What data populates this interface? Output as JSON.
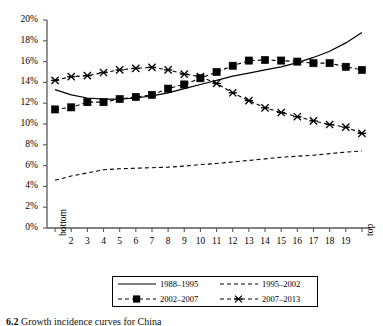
{
  "figure": {
    "caption_number": "6.2",
    "caption_text": "Growth incidence curves for China"
  },
  "axes": {
    "y_ticks": [
      "0%",
      "2%",
      "4%",
      "6%",
      "8%",
      "10%",
      "12%",
      "14%",
      "16%",
      "18%",
      "20%"
    ],
    "y_label": "",
    "x_label": "",
    "x_ticks": [
      "bottom",
      "2",
      "3",
      "4",
      "5",
      "6",
      "7",
      "8",
      "9",
      "10",
      "11",
      "12",
      "13",
      "14",
      "15",
      "16",
      "17",
      "18",
      "19",
      "top"
    ]
  },
  "legend": {
    "entries": [
      {
        "label": "1988–1995",
        "style": "solid",
        "marker": "none"
      },
      {
        "label": "1995–2002",
        "style": "dashed",
        "marker": "none"
      },
      {
        "label": "2002–2007",
        "style": "dashed",
        "marker": "square"
      },
      {
        "label": "2007–2013",
        "style": "dashed",
        "marker": "cross"
      }
    ]
  },
  "chart_data": {
    "type": "line",
    "title": "",
    "xlabel": "",
    "ylabel": "",
    "ylim": [
      0,
      20
    ],
    "y_unit": "%",
    "grid": false,
    "legend_position": "bottom",
    "categories": [
      "bottom",
      "2",
      "3",
      "4",
      "5",
      "6",
      "7",
      "8",
      "9",
      "10",
      "11",
      "12",
      "13",
      "14",
      "15",
      "16",
      "17",
      "18",
      "19",
      "top"
    ],
    "series": [
      {
        "name": "1988–1995",
        "style": "solid",
        "marker": "none",
        "color": "#000000",
        "values": [
          13.3,
          12.8,
          12.5,
          12.4,
          12.4,
          12.5,
          12.7,
          13.0,
          13.4,
          13.8,
          14.2,
          14.6,
          14.9,
          15.2,
          15.5,
          15.9,
          16.4,
          17.0,
          17.8,
          18.8
        ]
      },
      {
        "name": "1995–2002",
        "style": "dashed",
        "marker": "none",
        "color": "#000000",
        "values": [
          4.6,
          5.0,
          5.3,
          5.6,
          5.7,
          5.75,
          5.8,
          5.85,
          5.95,
          6.1,
          6.2,
          6.35,
          6.5,
          6.65,
          6.8,
          6.9,
          7.0,
          7.15,
          7.3,
          7.4
        ]
      },
      {
        "name": "2002–2007",
        "style": "dashed",
        "marker": "square",
        "color": "#000000",
        "values": [
          11.4,
          11.6,
          12.1,
          12.1,
          12.4,
          12.6,
          12.8,
          13.4,
          13.8,
          14.4,
          15.0,
          15.6,
          16.1,
          16.15,
          16.1,
          16.0,
          15.85,
          15.85,
          15.5,
          15.2
        ]
      },
      {
        "name": "2007–2013",
        "style": "dashed",
        "marker": "cross",
        "color": "#000000",
        "values": [
          14.2,
          14.55,
          14.65,
          14.95,
          15.2,
          15.35,
          15.45,
          15.2,
          14.8,
          14.55,
          13.9,
          13.0,
          12.25,
          11.55,
          11.1,
          10.7,
          10.3,
          9.95,
          9.7,
          9.1
        ]
      }
    ]
  }
}
